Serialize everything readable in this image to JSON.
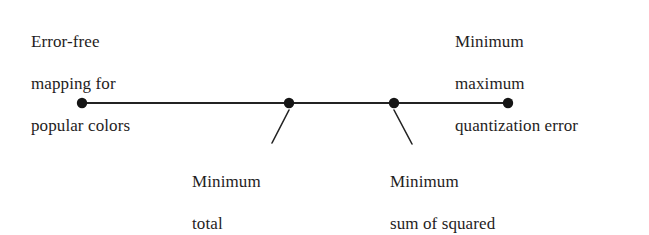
{
  "figure": {
    "type": "annotated-number-line",
    "background_color": "#ffffff",
    "ink_color": "#1f1d1d",
    "line_color": "#232323"
  },
  "axis": {
    "name": "quantization-tradeoff-spectrum",
    "start_x": 82,
    "end_x": 508,
    "y": 103,
    "stroke_width": 2,
    "dot_radius": 5
  },
  "points": [
    {
      "id": "error-free-mapping",
      "x": 82,
      "label_position": "above-left",
      "label_lines": [
        "Error-free",
        "mapping for",
        "popular colors"
      ],
      "label_text": "Error-free mapping for popular colors",
      "leader": false
    },
    {
      "id": "minimum-total-quantization-errors",
      "x": 289,
      "label_position": "below",
      "label_lines": [
        "Minimum",
        "total",
        "quantization errors"
      ],
      "label_text": "Minimum total quantization errors",
      "leader": true,
      "leader_from": [
        289,
        110
      ],
      "leader_to": [
        272,
        143
      ]
    },
    {
      "id": "minimum-sum-of-squared-errors",
      "x": 394,
      "label_position": "below",
      "label_lines": [
        "Minimum",
        "sum of squared",
        "errors"
      ],
      "label_text": "Minimum sum of squared errors",
      "leader": true,
      "leader_from": [
        394,
        110
      ],
      "leader_to": [
        412,
        144
      ]
    },
    {
      "id": "minimum-maximum-quantization-error",
      "x": 508,
      "label_position": "above-right",
      "label_lines": [
        "Minimum",
        "maximum",
        "quantization error"
      ],
      "label_text": "Minimum maximum quantization error",
      "leader": false
    }
  ],
  "labels": {
    "error_free": {
      "line1": "Error-free",
      "line2": "mapping for",
      "line3": "popular colors"
    },
    "min_max_quantization": {
      "line1": "Minimum",
      "line2": "maximum",
      "line3": "quantization error"
    },
    "min_total_quantization": {
      "line1": "Minimum",
      "line2": "total",
      "line3": "quantization errors"
    },
    "min_sum_squared": {
      "line1": "Minimum",
      "line2": "sum of squared",
      "line3": "errors"
    }
  }
}
